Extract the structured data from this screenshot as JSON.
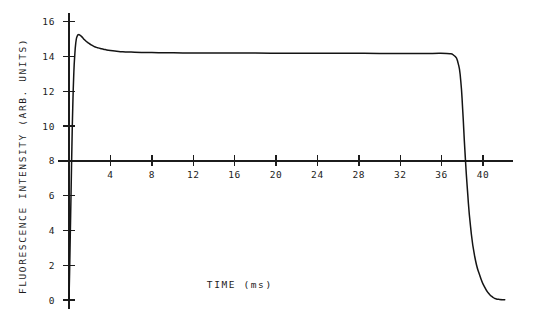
{
  "chart_data": {
    "type": "line",
    "title": "",
    "xlabel": "TIME (ms)",
    "ylabel": "FLUORESCENCE INTENSITY (ARB. UNITS)",
    "xlim": [
      0,
      43
    ],
    "ylim": [
      0,
      16.6
    ],
    "xticks": [
      4,
      8,
      12,
      16,
      20,
      24,
      28,
      32,
      36,
      40
    ],
    "yticks": [
      0,
      2,
      4,
      6,
      8,
      10,
      12,
      14,
      16
    ],
    "xtick_labels": [
      "4",
      "8",
      "12",
      "16",
      "20",
      "24",
      "28",
      "32",
      "36",
      "40"
    ],
    "ytick_labels": [
      "0",
      "2",
      "4",
      "6",
      "8",
      "10",
      "12",
      "14",
      "16"
    ],
    "grid": false,
    "legend": null,
    "x_axis_crosses_y_at": 8,
    "series": [
      {
        "name": "fluorescence induction transient",
        "color": "#141414",
        "x": [
          0.0,
          0.05,
          0.12,
          0.2,
          0.28,
          0.36,
          0.45,
          0.55,
          0.66,
          0.78,
          0.92,
          1.05,
          1.2,
          1.4,
          1.6,
          1.85,
          2.1,
          2.4,
          2.75,
          3.1,
          3.5,
          4.0,
          4.6,
          5.2,
          6.0,
          7.0,
          8.0,
          9.5,
          11.0,
          13.0,
          15.0,
          18.0,
          21.0,
          24.0,
          27.0,
          30.0,
          33.0,
          35.0,
          36.5,
          37.2,
          37.6,
          37.85,
          38.05,
          38.25,
          38.5,
          38.8,
          39.2,
          39.7,
          40.2,
          40.6,
          40.9,
          41.2,
          41.6,
          42.1
        ],
        "y": [
          0.0,
          1.4,
          3.6,
          6.2,
          8.8,
          11.0,
          12.8,
          14.0,
          14.8,
          15.15,
          15.25,
          15.22,
          15.15,
          15.02,
          14.9,
          14.78,
          14.68,
          14.58,
          14.5,
          14.44,
          14.39,
          14.34,
          14.3,
          14.27,
          14.25,
          14.23,
          14.22,
          14.21,
          14.2,
          14.2,
          14.19,
          14.19,
          14.18,
          14.18,
          14.18,
          14.17,
          14.17,
          14.17,
          14.16,
          14.05,
          13.6,
          12.6,
          10.8,
          8.6,
          6.3,
          4.2,
          2.5,
          1.4,
          0.7,
          0.35,
          0.18,
          0.08,
          0.03,
          0.02
        ]
      }
    ],
    "annotations": {
      "peak_value": 15.25,
      "peak_time_ms": 0.92,
      "plateau_value": 14.18,
      "decay_onset_ms": 37.2,
      "baseline_value": 0
    }
  },
  "geometry": {
    "plot_origin_x_px": 69,
    "plot_zero_y_px": 300,
    "x_px_per_ms": 10.35,
    "y_px_per_unit": 17.4,
    "axis_right_x_px": 513,
    "axis_top_y_px": 13,
    "axis_bottom_y_px": 309
  }
}
